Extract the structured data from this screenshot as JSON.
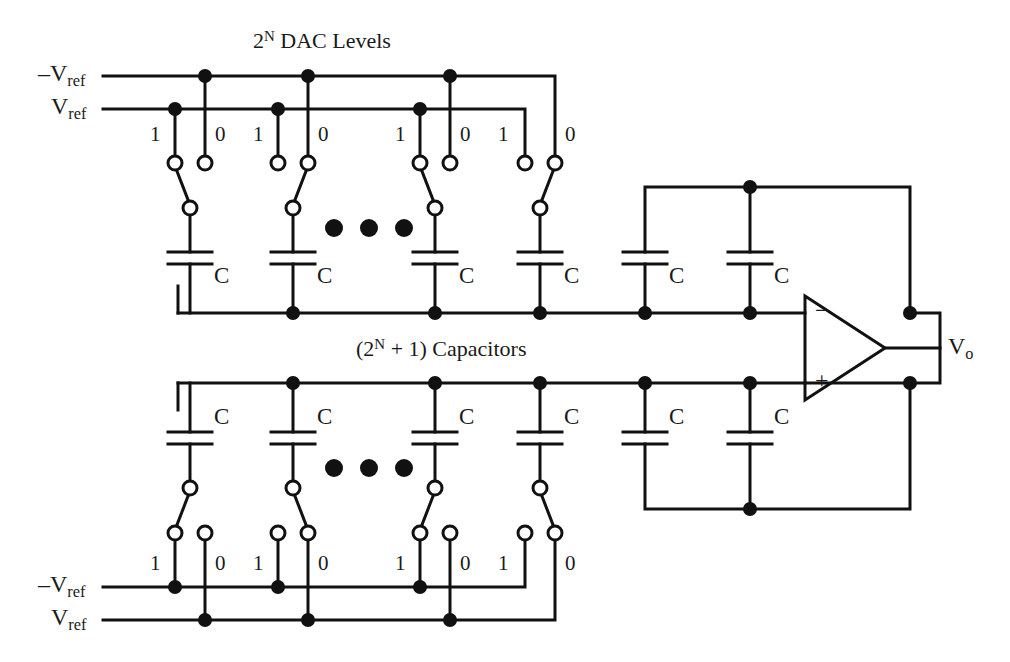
{
  "figure": {
    "type": "circuit-schematic",
    "title_top": "DAC Levels",
    "title_top_prefix": "2",
    "title_top_exponent": "N",
    "caption_mid_prefix": "(2",
    "caption_mid_exponent": "N",
    "caption_mid_suffix": " + 1) Capacitors",
    "stroke_color": "#111111",
    "background_color": "#ffffff",
    "node_fill": "#111111",
    "terminal_fill": "#ffffff"
  },
  "labels": {
    "vref_neg": "V",
    "vref_neg_prefix": "–",
    "vref_sub": "ref",
    "vref_pos": "V",
    "output": "V",
    "output_sub": "o",
    "capacitor": "C",
    "bit_one": "1",
    "bit_zero": "0",
    "opamp_minus": "−",
    "opamp_plus": "+"
  },
  "top_section": {
    "rail_neg_vref_label": "–V",
    "rail_pos_vref_label": "V",
    "rail_sub": "ref",
    "switch_columns": [
      {
        "index": 1,
        "bit_left": "1",
        "bit_right": "0",
        "selected": "1",
        "cap": "C"
      },
      {
        "index": 2,
        "bit_left": "1",
        "bit_right": "0",
        "selected": "0",
        "cap": "C"
      },
      {
        "index": 3,
        "bit_left": "1",
        "bit_right": "0",
        "selected": "1",
        "cap": "C"
      },
      {
        "index": 4,
        "bit_left": "1",
        "bit_right": "0",
        "selected": "0",
        "cap": "C"
      }
    ],
    "ellipsis": "• • •",
    "feedback_caps": [
      "C",
      "C"
    ]
  },
  "bottom_section": {
    "rail_neg_vref_label": "–V",
    "rail_pos_vref_label": "V",
    "rail_sub": "ref",
    "switch_columns": [
      {
        "index": 1,
        "bit_left": "1",
        "bit_right": "0",
        "selected": "1",
        "cap": "C"
      },
      {
        "index": 2,
        "bit_left": "1",
        "bit_right": "0",
        "selected": "0",
        "cap": "C"
      },
      {
        "index": 3,
        "bit_left": "1",
        "bit_right": "0",
        "selected": "1",
        "cap": "C"
      },
      {
        "index": 4,
        "bit_left": "1",
        "bit_right": "0",
        "selected": "0",
        "cap": "C"
      }
    ],
    "ellipsis": "• • •",
    "feedback_caps": [
      "C",
      "C"
    ]
  },
  "opamp": {
    "inverting_label": "−",
    "noninverting_label": "+",
    "output_label": "V",
    "output_sub": "o"
  }
}
